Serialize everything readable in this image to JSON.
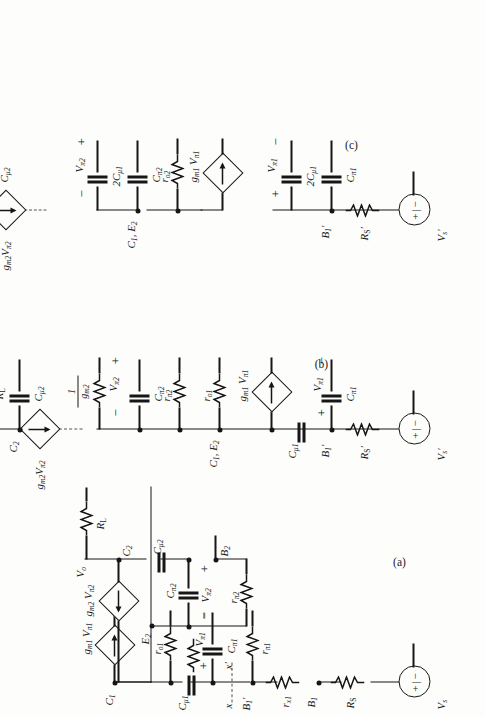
{
  "figure": {
    "orientation": "rotated-90-ccw",
    "panels": [
      {
        "id": "a",
        "label": "(a)"
      },
      {
        "id": "b",
        "label": "(b)"
      },
      {
        "id": "c",
        "label": "(c)"
      }
    ]
  },
  "symbols": {
    "ground": "ground-icon",
    "resistor": "resistor-icon",
    "capacitor": "capacitor-icon",
    "vccs": "dependent-current-source-icon",
    "vsource": "independent-voltage-source-icon",
    "terminal": "open-terminal-icon",
    "plus": "+",
    "minus": "−"
  },
  "panel_a": {
    "label": "(a)",
    "source": {
      "name": "V",
      "sub": "s",
      "plus": "+",
      "minus": "−"
    },
    "elements": [
      {
        "name": "R",
        "sub": "S",
        "type": "resistor"
      },
      {
        "name": "r",
        "sub": "x1",
        "type": "resistor"
      },
      {
        "name": "r",
        "sub": "π1",
        "type": "resistor"
      },
      {
        "name": "C",
        "sub": "π1",
        "type": "capacitor"
      },
      {
        "name": "C",
        "sub": "μ1",
        "type": "capacitor"
      },
      {
        "name": "r",
        "sub": "o1",
        "type": "resistor"
      },
      {
        "name": "g",
        "sub": "m1",
        "var": "V",
        "varsub": "π1",
        "type": "vccs"
      },
      {
        "name": "r",
        "sub": "π2",
        "type": "resistor"
      },
      {
        "name": "C",
        "sub": "π2",
        "type": "capacitor"
      },
      {
        "name": "C",
        "sub": "μ2",
        "type": "capacitor"
      },
      {
        "name": "g",
        "sub": "m2",
        "var": "V",
        "varsub": "π2",
        "type": "vccs"
      },
      {
        "name": "R",
        "sub": "L",
        "type": "resistor"
      }
    ],
    "nodes": [
      {
        "name": "B",
        "sub": "1"
      },
      {
        "name": "B",
        "sub": "1",
        "prime": true
      },
      {
        "name": "C",
        "sub": "1"
      },
      {
        "name": "E",
        "sub": "2"
      },
      {
        "name": "B",
        "sub": "2"
      },
      {
        "name": "C",
        "sub": "2"
      },
      {
        "name": "V",
        "sub": "o"
      }
    ],
    "cut": {
      "left": "x",
      "right": "x′",
      "style": "dashed"
    },
    "voltages": [
      {
        "name": "V",
        "sub": "π1",
        "plus": "+",
        "minus": "−"
      },
      {
        "name": "V",
        "sub": "π2",
        "plus": "+",
        "minus": "−"
      }
    ]
  },
  "panel_b": {
    "label": "(b)",
    "source": {
      "name": "V",
      "sub": "s",
      "prime": true,
      "plus": "+",
      "minus": "−"
    },
    "elements": [
      {
        "name": "R",
        "sub": "S",
        "prime": true,
        "type": "resistor"
      },
      {
        "name": "C",
        "sub": "π1",
        "type": "capacitor"
      },
      {
        "name": "C",
        "sub": "μ1",
        "type": "capacitor"
      },
      {
        "name": "g",
        "sub": "m1",
        "var": "V",
        "varsub": "π1",
        "type": "vccs"
      },
      {
        "name": "r",
        "sub": "o1",
        "type": "resistor"
      },
      {
        "name": "r",
        "sub": "π2",
        "type": "resistor"
      },
      {
        "name": "C",
        "sub": "π2",
        "type": "capacitor"
      },
      {
        "name": "1/g",
        "sub": "m2",
        "type": "resistor",
        "fraction": {
          "num": "1",
          "den": "g",
          "densub": "m2"
        }
      },
      {
        "name": "C",
        "sub": "μ2",
        "type": "capacitor"
      },
      {
        "name": "g",
        "sub": "m2",
        "var": "V",
        "varsub": "π2",
        "type": "vccs"
      },
      {
        "name": "R",
        "sub": "L",
        "type": "resistor"
      }
    ],
    "nodes": [
      {
        "name": "B",
        "sub": "1",
        "prime": true
      },
      {
        "name": "C",
        "sub": "1",
        "sub2": "E",
        "sub2n": "2",
        "combined": "C₁, E₂"
      },
      {
        "name": "C",
        "sub": "2"
      },
      {
        "name": "V",
        "sub": "o",
        "terminal": true
      }
    ],
    "voltages": [
      {
        "name": "V",
        "sub": "π1",
        "plus": "+",
        "minus": "−"
      },
      {
        "name": "V",
        "sub": "π2",
        "plus": "+",
        "minus": "−"
      }
    ],
    "break": "dashed-break"
  },
  "panel_c": {
    "label": "(c)",
    "source": {
      "name": "V",
      "sub": "s",
      "prime": true,
      "plus": "+",
      "minus": "−"
    },
    "elements": [
      {
        "name": "R",
        "sub": "S",
        "prime": true,
        "type": "resistor"
      },
      {
        "name": "C",
        "sub": "π1",
        "type": "capacitor"
      },
      {
        "name": "2C",
        "sub": "μ1",
        "type": "capacitor"
      },
      {
        "name": "g",
        "sub": "m1",
        "var": "V",
        "varsub": "π1",
        "type": "vccs"
      },
      {
        "name": "r",
        "sub": "o2",
        "type": "resistor"
      },
      {
        "name": "C",
        "sub": "π2",
        "type": "capacitor"
      },
      {
        "name": "2C",
        "sub": "μ1",
        "type": "capacitor"
      },
      {
        "name": "g",
        "sub": "m2",
        "var": "V",
        "varsub": "π2",
        "type": "vccs"
      },
      {
        "name": "C",
        "sub": "μ2",
        "type": "capacitor"
      },
      {
        "name": "R",
        "sub": "L",
        "type": "resistor"
      }
    ],
    "nodes": [
      {
        "name": "B",
        "sub": "1",
        "prime": true
      },
      {
        "name": "C",
        "sub": "1",
        "combined": "C₁, E₂"
      },
      {
        "name": "C",
        "sub": "2"
      },
      {
        "name": "V",
        "sub": "o",
        "terminal": true
      }
    ],
    "voltages": [
      {
        "name": "V",
        "sub": "π1",
        "plus": "+",
        "minus": "−"
      },
      {
        "name": "V",
        "sub": "π2",
        "plus": "+",
        "minus": "−"
      }
    ],
    "break": "dashed-break"
  },
  "labels": {
    "Rs": "R",
    "RL": "R",
    "Vs": "V",
    "Vo": "V",
    "sub_S": "S",
    "sub_L": "L",
    "sub_s": "s",
    "sub_o": "o",
    "rx1": "r",
    "sub_x1": "x1",
    "rpi1": "r",
    "sub_pi1": "π1",
    "rpi2": "r",
    "sub_pi2": "π2",
    "ro1": "r",
    "sub_o1": "o1",
    "ro2": "r",
    "sub_o2": "o2",
    "Cpi1": "C",
    "Cpi2": "C",
    "Cmu1": "C",
    "sub_mu1": "μ1",
    "Cmu2": "C",
    "sub_mu2": "μ2",
    "twoCmu1": "2C",
    "gm1": "g",
    "sub_m1": "m1",
    "gm2": "g",
    "sub_m2": "m2",
    "Vpi1": "V",
    "Vpi2": "V",
    "B1": "B",
    "B2": "B",
    "C1": "C",
    "C2": "C",
    "E2": "E",
    "sub_1": "1",
    "sub_2": "2",
    "prime": "′",
    "cut_x": "x",
    "cut_xp": "x′",
    "C1E2": "C₁, E₂",
    "one": "1"
  }
}
